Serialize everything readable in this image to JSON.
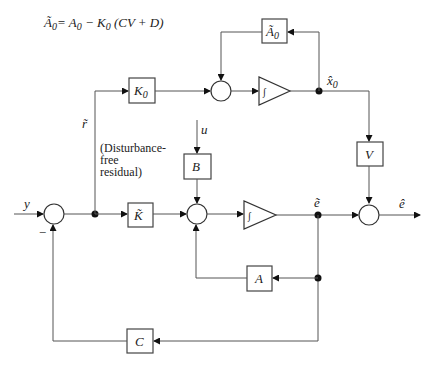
{
  "equation": {
    "lhs": "Ã",
    "lhs_sub": "0",
    "rhs": "= A",
    "rhs_sub1": "0",
    "minus_k": " − K",
    "k_sub": "0",
    "tail": " (CV + D)"
  },
  "blocks": {
    "a0_tilde": {
      "main": "Ã",
      "sub": "0"
    },
    "k0": {
      "main": "K",
      "sub": "0"
    },
    "k_tilde": {
      "main": "K̃"
    },
    "b": {
      "main": "B"
    },
    "a": {
      "main": "A"
    },
    "c": {
      "main": "C"
    },
    "v": {
      "main": "V"
    }
  },
  "signals": {
    "y": "y",
    "u": "u",
    "r_tilde": "r̃",
    "x0_hat": "x̂",
    "x0_hat_sub": "0",
    "e_tilde": "ẽ",
    "e_hat": "ê",
    "minus": "−"
  },
  "annotation": {
    "line1": "(Disturbance-",
    "line2": "free",
    "line3": "residual)"
  },
  "integrator_symbol": "∫"
}
